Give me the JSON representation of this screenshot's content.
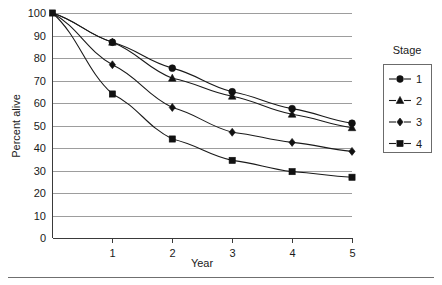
{
  "chart_data": {
    "type": "line",
    "title": "",
    "xlabel": "Year",
    "ylabel": "Percent alive",
    "x": [
      0,
      1,
      2,
      3,
      4,
      5
    ],
    "xticks": [
      "1",
      "2",
      "3",
      "4",
      "5"
    ],
    "xtick_values": [
      1,
      2,
      3,
      4,
      5
    ],
    "xlim": [
      0,
      5
    ],
    "yticks": [
      "0",
      "10",
      "20",
      "30",
      "40",
      "50",
      "60",
      "70",
      "80",
      "90",
      "100"
    ],
    "ytick_values": [
      0,
      10,
      20,
      30,
      40,
      50,
      60,
      70,
      80,
      90,
      100
    ],
    "ylim": [
      0,
      100
    ],
    "grid": "horizontal",
    "legend_position": "right",
    "legend_title": "Stage",
    "series": [
      {
        "name": "1",
        "marker": "circle",
        "values": [
          100,
          87,
          75.5,
          65,
          57.5,
          51
        ]
      },
      {
        "name": "2",
        "marker": "triangle",
        "values": [
          100,
          87,
          71,
          63,
          55,
          49
        ]
      },
      {
        "name": "3",
        "marker": "diamond",
        "values": [
          100,
          77,
          58,
          47,
          42.5,
          38.5
        ]
      },
      {
        "name": "4",
        "marker": "square",
        "values": [
          100,
          64,
          44,
          34.5,
          29.5,
          27
        ]
      }
    ]
  },
  "colors": {
    "line": "#1a1a1a",
    "marker": "#111111",
    "gridline": "#9d9d9d",
    "axis": "#3a3a3a",
    "background": "#ffffff",
    "legend_border": "#6b6b6b"
  }
}
